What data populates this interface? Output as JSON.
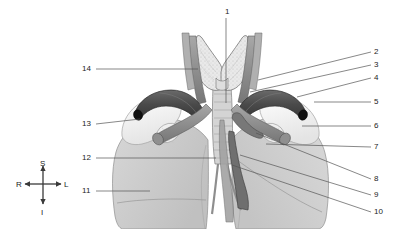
{
  "figure": {
    "background_color": "#ffffff",
    "leader_line_color": "#555555",
    "label_color": "#1c1c1c"
  },
  "orientation_compass": {
    "name": "anatomical-orientation-indicator",
    "superior": "S",
    "inferior": "I",
    "right": "R",
    "left": "L",
    "center": {
      "x": 42,
      "y": 185
    }
  },
  "labels": [
    {
      "id": "1",
      "text": "1",
      "side": "top",
      "x": 225,
      "y": 8,
      "leader": {
        "x1": 226,
        "y1": 18,
        "x2": 226,
        "y2": 103
      }
    },
    {
      "id": "2",
      "text": "2",
      "side": "right",
      "x": 374,
      "y": 48,
      "leader": {
        "x1": 371,
        "y1": 52,
        "x2": 258,
        "y2": 80
      }
    },
    {
      "id": "3",
      "text": "3",
      "side": "right",
      "x": 374,
      "y": 61,
      "leader": {
        "x1": 371,
        "y1": 65,
        "x2": 250,
        "y2": 92
      }
    },
    {
      "id": "4",
      "text": "4",
      "side": "right",
      "x": 374,
      "y": 74,
      "leader": {
        "x1": 371,
        "y1": 78,
        "x2": 297,
        "y2": 97
      }
    },
    {
      "id": "5",
      "text": "5",
      "side": "right",
      "x": 374,
      "y": 98,
      "leader": {
        "x1": 371,
        "y1": 102,
        "x2": 314,
        "y2": 102
      }
    },
    {
      "id": "6",
      "text": "6",
      "side": "right",
      "x": 374,
      "y": 122,
      "leader": {
        "x1": 371,
        "y1": 126,
        "x2": 302,
        "y2": 126
      }
    },
    {
      "id": "7",
      "text": "7",
      "side": "right",
      "x": 374,
      "y": 143,
      "leader": {
        "x1": 371,
        "y1": 147,
        "x2": 266,
        "y2": 144
      }
    },
    {
      "id": "8",
      "text": "8",
      "side": "right",
      "x": 374,
      "y": 175,
      "leader": {
        "x1": 371,
        "y1": 179,
        "x2": 256,
        "y2": 133
      }
    },
    {
      "id": "9",
      "text": "9",
      "side": "right",
      "x": 374,
      "y": 191,
      "leader": {
        "x1": 371,
        "y1": 195,
        "x2": 240,
        "y2": 155
      }
    },
    {
      "id": "10",
      "text": "10",
      "side": "right",
      "x": 374,
      "y": 208,
      "leader": {
        "x1": 371,
        "y1": 212,
        "x2": 232,
        "y2": 165
      }
    },
    {
      "id": "11",
      "text": "11",
      "side": "left",
      "x": 82,
      "y": 187,
      "leader": {
        "x1": 96,
        "y1": 191,
        "x2": 150,
        "y2": 191
      }
    },
    {
      "id": "12",
      "text": "12",
      "side": "left",
      "x": 82,
      "y": 154,
      "leader": {
        "x1": 96,
        "y1": 158,
        "x2": 216,
        "y2": 158
      }
    },
    {
      "id": "13",
      "text": "13",
      "side": "left",
      "x": 82,
      "y": 120,
      "leader": {
        "x1": 96,
        "y1": 124,
        "x2": 140,
        "y2": 119
      }
    },
    {
      "id": "14",
      "text": "14",
      "side": "left",
      "x": 82,
      "y": 65,
      "leader": {
        "x1": 96,
        "y1": 69,
        "x2": 198,
        "y2": 69
      }
    }
  ],
  "structures": {
    "thyroid_gland": {
      "name": "thyroid-gland",
      "fill": "#e9e9e9",
      "stroke": "#6b6b6b"
    },
    "trachea": {
      "name": "trachea",
      "fill": "#d5d5d5",
      "stroke": "#777777"
    },
    "lung_right": {
      "name": "right-lung",
      "fill": "#c9c9c9",
      "stroke": "#8a8a8a"
    },
    "lung_left": {
      "name": "left-lung",
      "fill": "#cdcdcd",
      "stroke": "#8a8a8a"
    },
    "clavicle_right": {
      "name": "right-clavicle",
      "fill": "#f6f6f6",
      "stroke": "#9a9a9a"
    },
    "clavicle_left": {
      "name": "left-clavicle",
      "fill": "#f6f6f6",
      "stroke": "#9a9a9a"
    },
    "subclavian_artery_dark": {
      "name": "subclavian-artery",
      "fill": "#4f4f4f",
      "stroke": "#2e2e2e"
    },
    "carotid_vessels": {
      "name": "common-carotid-arteries",
      "fill": "#8f8f8f",
      "stroke": "#5e5e5e"
    },
    "jugular_vessels": {
      "name": "internal-jugular-veins",
      "fill": "#a5a5a5",
      "stroke": "#6f6f6f"
    },
    "aortic_arch": {
      "name": "aortic-arch",
      "fill": "#9a9a9a",
      "stroke": "#5a5a5a"
    },
    "vessel_lumen": {
      "name": "vessel-lumen-opening",
      "fill": "#121212"
    }
  }
}
